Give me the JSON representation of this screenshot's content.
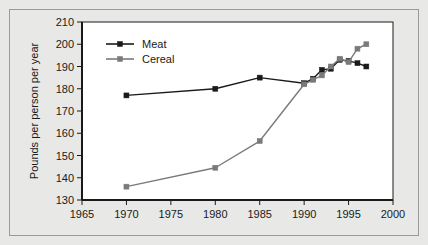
{
  "chart_data": {
    "type": "line",
    "title": "",
    "xlabel": "",
    "ylabel": "Pounds per person per year",
    "xlim": [
      1965,
      2000
    ],
    "ylim": [
      130,
      210
    ],
    "xticks": [
      1965,
      1970,
      1975,
      1980,
      1985,
      1990,
      1995,
      2000
    ],
    "yticks": [
      130,
      140,
      150,
      160,
      170,
      180,
      190,
      200,
      210
    ],
    "grid": false,
    "legend_position": "top-left",
    "series": [
      {
        "name": "Meat",
        "color": "#1a1a1a",
        "marker": "square",
        "x": [
          1970,
          1980,
          1985,
          1990,
          1991,
          1992,
          1993,
          1994,
          1995,
          1996,
          1997
        ],
        "values": [
          177,
          180,
          185,
          182.5,
          184.5,
          188.5,
          189,
          193,
          192.5,
          191.5,
          190
        ]
      },
      {
        "name": "Cereal",
        "color": "#7a7a7a",
        "marker": "square",
        "x": [
          1970,
          1980,
          1985,
          1990,
          1991,
          1992,
          1993,
          1994,
          1995,
          1996,
          1997
        ],
        "values": [
          136,
          144.5,
          156.5,
          182,
          184,
          186,
          190,
          193.5,
          192,
          198,
          200
        ]
      }
    ]
  },
  "legend": {
    "items": [
      {
        "label": "Meat"
      },
      {
        "label": "Cereal"
      }
    ]
  },
  "axes": {
    "y_title": "Pounds per person per year",
    "y_tick_labels": [
      "130",
      "140",
      "150",
      "160",
      "170",
      "180",
      "190",
      "200",
      "210"
    ],
    "x_tick_labels": [
      "1965",
      "1970",
      "1975",
      "1980",
      "1985",
      "1990",
      "1995",
      "2000"
    ]
  }
}
